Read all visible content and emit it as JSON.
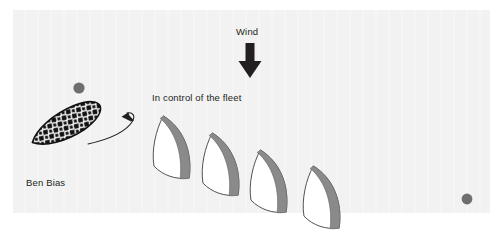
{
  "diagram": {
    "background_color": "#f2f2f2",
    "page_color": "#ffffff",
    "ink_color": "#231f20",
    "sail_shadow_color": "#8a8a8a",
    "hull_fill_color": "#ffffff",
    "mark_color": "#6e6e6e",
    "labels": {
      "wind": "Wind",
      "fleet": "In control of the fleet",
      "boat": "Ben Bias"
    },
    "icons": {
      "wind_arrow": "wind-arrow-down-icon",
      "pointer_arrow": "curved-pointer-arrow-icon"
    },
    "marks": [
      {
        "name": "upwind-mark",
        "x": 79,
        "y": 88,
        "r": 5.5
      },
      {
        "name": "downwind-mark",
        "x": 467,
        "y": 199,
        "r": 5.5
      },
      {
        "name": "layline-mark",
        "x": 79,
        "y": 88,
        "r": 5.5
      }
    ],
    "focus_boat": {
      "name": "Ben Bias",
      "style": "hatched",
      "x": 60,
      "y": 155,
      "rotation": -28
    },
    "fleet_boats": [
      {
        "index": 1,
        "x": 188,
        "y": 147,
        "rotation": 42
      },
      {
        "index": 2,
        "x": 236,
        "y": 163,
        "rotation": 42
      },
      {
        "index": 3,
        "x": 285,
        "y": 180,
        "rotation": 42
      },
      {
        "index": 4,
        "x": 338,
        "y": 197,
        "rotation": 42
      }
    ],
    "wind": {
      "direction": "from top",
      "arrow_x": 250,
      "arrow_top": 44,
      "arrow_bottom": 78
    }
  }
}
